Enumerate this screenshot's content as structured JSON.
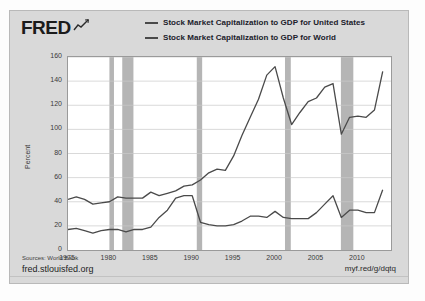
{
  "brand": {
    "logo_text": "FRED",
    "logo_icon": "squiggle-chart-icon"
  },
  "legend": {
    "series": [
      {
        "label": "Stock Market Capitalization to GDP for United States",
        "color": "#4a4a4a"
      },
      {
        "label": "Stock Market Capitalization to GDP for World",
        "color": "#4a4a4a"
      }
    ]
  },
  "footer": {
    "sources": "Sources: World Bank",
    "fred_url": "fred.stlouisfed.org",
    "short_url": "myf.red/g/dqtq"
  },
  "chart_data": {
    "type": "line",
    "title": "",
    "xlabel": "",
    "ylabel": "Percent",
    "xlim": [
      1975,
      2014
    ],
    "ylim": [
      0,
      160
    ],
    "yticks": [
      0,
      20,
      40,
      60,
      80,
      100,
      120,
      140,
      160
    ],
    "xticks": [
      1975,
      1980,
      1985,
      1990,
      1995,
      2000,
      2005,
      2010
    ],
    "grid": true,
    "legend_position": "top",
    "recession_bands": [
      {
        "start": 1980.0,
        "end": 1980.55
      },
      {
        "start": 1981.55,
        "end": 1982.9
      },
      {
        "start": 1990.55,
        "end": 1991.2
      },
      {
        "start": 2001.2,
        "end": 2001.9
      },
      {
        "start": 2007.95,
        "end": 2009.45
      }
    ],
    "recession_color": "#b5b5b5",
    "x": [
      1975,
      1976,
      1977,
      1978,
      1979,
      1980,
      1981,
      1982,
      1983,
      1984,
      1985,
      1986,
      1987,
      1988,
      1989,
      1990,
      1991,
      1992,
      1993,
      1994,
      1995,
      1996,
      1997,
      1998,
      1999,
      2000,
      2001,
      2002,
      2003,
      2004,
      2005,
      2006,
      2007,
      2008,
      2009,
      2010,
      2011,
      2012,
      2013
    ],
    "series": [
      {
        "name": "Stock Market Capitalization to GDP for United States",
        "color": "#4a4a4a",
        "values": [
          42,
          44,
          42,
          38,
          39,
          40,
          44,
          43,
          43,
          43,
          48,
          45,
          47,
          49,
          53,
          54,
          58,
          64,
          67,
          66,
          78,
          95,
          110,
          125,
          145,
          152,
          126,
          104,
          114,
          123,
          126,
          135,
          138,
          96,
          110,
          111,
          110,
          116,
          148
        ]
      },
      {
        "name": "Stock Market Capitalization to GDP for World",
        "color": "#4a4a4a",
        "values": [
          17,
          18,
          16,
          14,
          16,
          17,
          17,
          15,
          17,
          17,
          19,
          27,
          33,
          43,
          45,
          45,
          23,
          21,
          20,
          20,
          21,
          24,
          28,
          28,
          27,
          32,
          27,
          26,
          26,
          26,
          31,
          38,
          45,
          27,
          33,
          33,
          31,
          31,
          50
        ]
      }
    ]
  }
}
